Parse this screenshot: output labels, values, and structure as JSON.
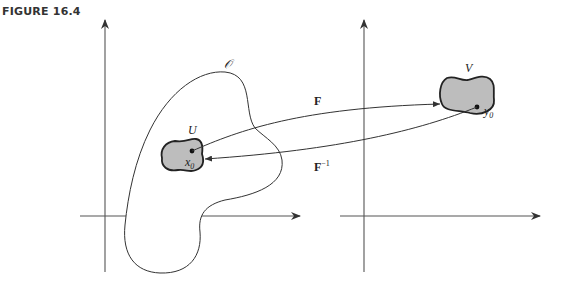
{
  "figure": {
    "label": "FIGURE 16.4"
  },
  "labels": {
    "open_set": "𝒪",
    "domain_set": "U",
    "domain_point": "x",
    "domain_point_sub": "0",
    "range_set": "V",
    "range_point": "y",
    "range_point_sub": "0",
    "forward_map": "F",
    "inverse_map": "F",
    "inverse_sup": "−1"
  },
  "colors": {
    "line": "#333333",
    "set_fill": "#bdbdbd",
    "background": "#ffffff"
  }
}
